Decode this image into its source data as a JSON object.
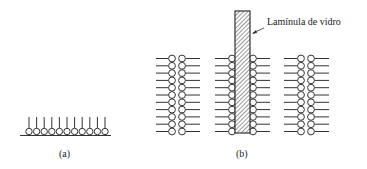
{
  "figure": {
    "panel_a": {
      "caption": "(a)",
      "description": "Monolayer of amphiphilic molecules on a surface, polar heads down, tails up",
      "molecule_count": 11
    },
    "panel_b": {
      "caption": "(b)",
      "slide_label": "Lamínula de vidro",
      "rows_per_column": 11,
      "description": "Bilayers with a glass coverslip dipped through, molecules coating both sides"
    },
    "colors": {
      "ink": "#333333",
      "background": "#ffffff"
    }
  }
}
